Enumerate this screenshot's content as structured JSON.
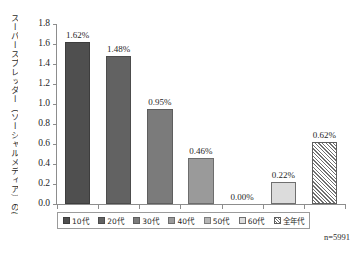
{
  "chart_data": {
    "type": "bar",
    "title": "",
    "xlabel": "",
    "ylabel": "スーパースプレッダー（ソーシャルメディア）の割合（％）",
    "categories": [
      "10代",
      "20代",
      "30代",
      "40代",
      "50代",
      "60代",
      "全年代"
    ],
    "values": [
      1.62,
      1.48,
      0.95,
      0.46,
      0.0,
      0.22,
      0.62
    ],
    "data_labels": [
      "1.62%",
      "1.48%",
      "0.95%",
      "0.46%",
      "0.00%",
      "0.22%",
      "0.62%"
    ],
    "ylim": [
      0.0,
      1.8
    ],
    "ytick_labels": [
      "0.0",
      "0.2",
      "0.4",
      "0.6",
      "0.8",
      "1.0",
      "1.2",
      "1.4",
      "1.6",
      "1.8"
    ],
    "ytick_values": [
      0.0,
      0.2,
      0.4,
      0.6,
      0.8,
      1.0,
      1.2,
      1.4,
      1.6,
      1.8
    ],
    "grid": false,
    "legend_position": "bottom",
    "legend": [
      "10代",
      "20代",
      "30代",
      "40代",
      "50代",
      "60代",
      "全年代"
    ],
    "series_colors": [
      "#4f4f4f",
      "#626262",
      "#7b7b7b",
      "#9a9a9a",
      "#b6b6b6",
      "#dcdcdc",
      "#ffffff"
    ],
    "annotations": [
      "n=5991"
    ]
  },
  "footnote": {
    "sample_size": "n=5991"
  },
  "caption": {
    "text": ""
  }
}
